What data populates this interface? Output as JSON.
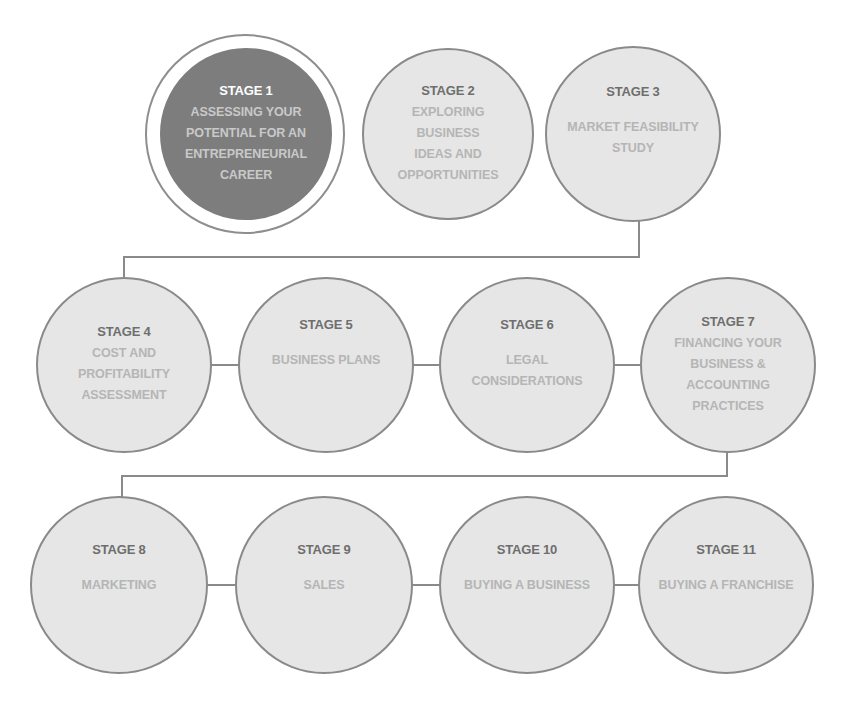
{
  "diagram": {
    "colors": {
      "active_fill": "#7d7d7d",
      "inactive_fill": "#e6e6e6",
      "outline": "#8a8a8a",
      "stage_label_active": "#ffffff",
      "stage_label": "#6e6e6e",
      "description_text": "#b5b5b5"
    },
    "stages": [
      {
        "label": "STAGE 1",
        "description": "ASSESSING YOUR\nPOTENTIAL FOR AN\nENTREPRENEURIAL\nCAREER",
        "active": true
      },
      {
        "label": "STAGE 2",
        "description": "EXPLORING\nBUSINESS\nIDEAS AND\nOPPORTUNITIES",
        "active": false
      },
      {
        "label": "STAGE 3",
        "description": "MARKET FEASIBILITY\nSTUDY",
        "active": false
      },
      {
        "label": "STAGE 4",
        "description": "COST AND\nPROFITABILITY\nASSESSMENT",
        "active": false
      },
      {
        "label": "STAGE 5",
        "description": "BUSINESS PLANS",
        "active": false
      },
      {
        "label": "STAGE 6",
        "description": "LEGAL\nCONSIDERATIONS",
        "active": false
      },
      {
        "label": "STAGE 7",
        "description": "FINANCING YOUR\nBUSINESS &\nACCOUNTING\nPRACTICES",
        "active": false
      },
      {
        "label": "STAGE 8",
        "description": "MARKETING",
        "active": false
      },
      {
        "label": "STAGE 9",
        "description": "SALES",
        "active": false
      },
      {
        "label": "STAGE 10",
        "description": "BUYING A BUSINESS",
        "active": false
      },
      {
        "label": "STAGE 11",
        "description": "BUYING A FRANCHISE",
        "active": false
      }
    ]
  }
}
